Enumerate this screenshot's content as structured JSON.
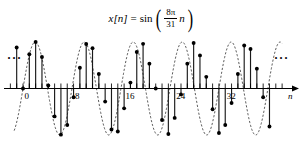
{
  "figure": {
    "title_formula": {
      "lhs": "x[n]",
      "equals": "=",
      "func": "sin",
      "paren_open": "(",
      "paren_close": ")",
      "numerator": "8π",
      "denominator": "31",
      "arg_var": "n",
      "plain_text": "x[n] = sin( 8π / 31 · n )"
    },
    "ellipsis_left": "···",
    "ellipsis_right": "···",
    "axis_label": "n",
    "colors": {
      "line": "#000000",
      "stem": "#1a1a1a",
      "envelope": "#333333",
      "marker": "#000000",
      "background": "#ffffff"
    }
  },
  "chart_data": {
    "type": "line",
    "subtitle": "",
    "xlabel": "n",
    "ylabel": "",
    "grid": false,
    "legend": null,
    "xlim": [
      -4,
      40
    ],
    "ylim": [
      -1.1,
      1.1
    ],
    "xticks": [
      0,
      8,
      16,
      24,
      32
    ],
    "xtick_labels": [
      "0",
      "8",
      "16",
      "24",
      "32"
    ],
    "yticks": [],
    "formula": "x[n] = sin((8*pi/31)*n)",
    "frequency_numerator": 8,
    "frequency_denominator": 31,
    "period": 31,
    "amplitude": 1,
    "marker": "filled-circle",
    "stem_style": "solid",
    "envelope_style": "dashed",
    "x": [
      -4,
      -3,
      -2,
      -1,
      0,
      1,
      2,
      3,
      4,
      5,
      6,
      7,
      8,
      9,
      10,
      11,
      12,
      13,
      14,
      15,
      16,
      17,
      18,
      19,
      20,
      21,
      22,
      23,
      24,
      25,
      26,
      27,
      28,
      29,
      30,
      31,
      32,
      33,
      34,
      35,
      36,
      37,
      38,
      39
    ],
    "values": [
      -0.8502,
      -0.2817,
      0.3943,
      0.8817,
      0.0,
      0.7357,
      0.9987,
      0.6785,
      0.0634,
      -0.5998,
      -0.9921,
      -0.7847,
      -0.1893,
      0.4457,
      0.9562,
      0.868,
      0.3123,
      -0.2817,
      -0.8817,
      -0.9261,
      -0.4264,
      0.1269,
      0.7847,
      0.9603,
      0.5348,
      0.0,
      -0.6785,
      -0.9801,
      -0.6327,
      -0.1269,
      0.5348,
      0.9801,
      0.7113,
      0.2504,
      -0.4457,
      -0.9562,
      -0.7847,
      -0.3123,
      0.3123,
      0.9261,
      0.8502,
      0.4264,
      -0.1893,
      -0.8178
    ]
  }
}
